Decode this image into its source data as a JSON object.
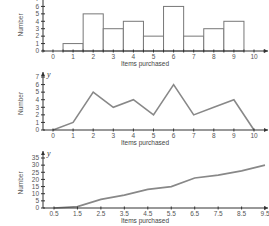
{
  "chart_data": [
    {
      "type": "bar",
      "subtype": "histogram",
      "xlabel": "Items purchased",
      "ylabel": "Number",
      "categories": [
        0,
        1,
        2,
        3,
        4,
        5,
        6,
        7,
        8,
        9,
        10
      ],
      "values": [
        0,
        1,
        5,
        3,
        4,
        2,
        6,
        2,
        3,
        4,
        0
      ],
      "y_ticks": [
        0,
        1,
        2,
        3,
        4,
        5,
        6,
        7
      ],
      "ylim": [
        0,
        7
      ],
      "grid": false,
      "legend": null
    },
    {
      "type": "line",
      "subtype": "frequency-polygon",
      "xlabel": "Items purchased",
      "ylabel": "Number",
      "y_axis_variable": "y",
      "x": [
        0,
        1,
        2,
        3,
        4,
        5,
        6,
        7,
        8,
        9,
        10
      ],
      "values": [
        0,
        1,
        5,
        3,
        4,
        2,
        6,
        2,
        3,
        4,
        0
      ],
      "y_ticks": [
        0,
        1,
        2,
        3,
        4,
        5,
        6,
        7
      ],
      "ylim": [
        0,
        7
      ],
      "grid": false,
      "legend": null
    },
    {
      "type": "line",
      "subtype": "cumulative-frequency",
      "xlabel": "Items purchased",
      "ylabel": "Number",
      "y_axis_variable": "y",
      "x": [
        0.5,
        1.5,
        2.5,
        3.5,
        4.5,
        5.5,
        6.5,
        7.5,
        8.5,
        9.5
      ],
      "x_tick_labels": [
        "0.5",
        "1.5",
        "2.5",
        "3.5",
        "4.5",
        "5.5",
        "6.5",
        "7.5",
        "8.5",
        "9.5"
      ],
      "values": [
        0,
        1,
        6,
        9,
        13,
        15,
        21,
        23,
        26,
        30
      ],
      "y_ticks": [
        0,
        5,
        10,
        15,
        20,
        25,
        30,
        35
      ],
      "ylim": [
        0,
        35
      ],
      "grid": false,
      "legend": null
    }
  ]
}
